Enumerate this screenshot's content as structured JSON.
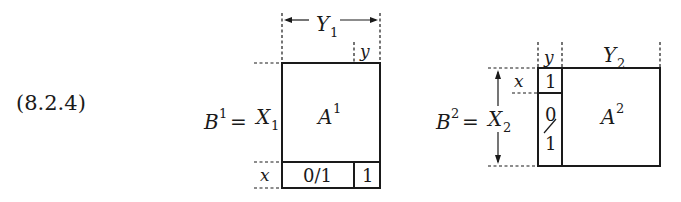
{
  "equation_label": "(8.2.4)",
  "matrix1": {
    "lhs": "B",
    "lhs_sup": "1",
    "equals": "=",
    "row_label": "X",
    "row_label_sub": "1",
    "col_label": "Y",
    "col_label_sub": "1",
    "small_col_label": "y",
    "small_row_label": "x",
    "block_label": "A",
    "block_label_sup": "1",
    "bottom_left_cell": "0/1",
    "bottom_right_cell": "1"
  },
  "matrix2": {
    "lhs": "B",
    "lhs_sup": "2",
    "equals": "=",
    "row_label": "X",
    "row_label_sub": "2",
    "col_label": "Y",
    "col_label_sub": "2",
    "small_col_label": "y",
    "small_row_label": "x",
    "block_label": "A",
    "block_label_sup": "2",
    "top_left_cell": "1",
    "left_column_top": "0",
    "left_column_bottom": "1"
  }
}
